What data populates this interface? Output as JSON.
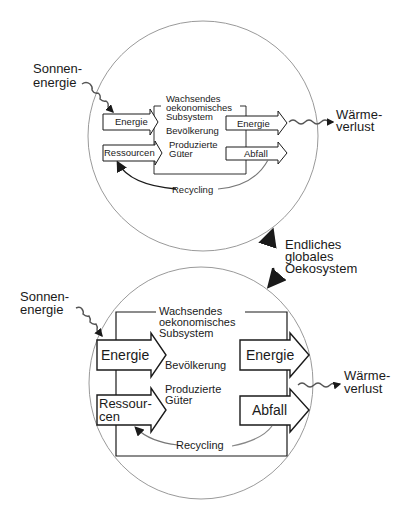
{
  "diagram": {
    "connector": {
      "label_lines": [
        "Endliches",
        "globales",
        "Oekosystem"
      ]
    },
    "top": {
      "input_label_lines": [
        "Sonnen-",
        "energie"
      ],
      "output_label_lines": [
        "Wärme-",
        "verlust"
      ],
      "subsystem_label_lines": [
        "Wachsendes",
        "oekonomisches",
        "Subsystem"
      ],
      "inner_labels": [
        "Bevölkerung",
        "Produzierte",
        "Güter"
      ],
      "inputs": [
        {
          "label": "Energie"
        },
        {
          "label": "Ressourcen"
        }
      ],
      "outputs": [
        {
          "label": "Energie"
        },
        {
          "label": "Abfall"
        }
      ],
      "recycling_label": "Recycling"
    },
    "bottom": {
      "input_label_lines": [
        "Sonnen-",
        "energie"
      ],
      "output_label_lines": [
        "Wärme-",
        "verlust"
      ],
      "subsystem_label_lines": [
        "Wachsendes",
        "oekonomisches",
        "Subsystem"
      ],
      "inner_labels": [
        "Bevölkerung",
        "Produzierte",
        "Güter"
      ],
      "inputs": [
        {
          "label": "Energie"
        },
        {
          "label_lines": [
            "Ressour-",
            "cen"
          ]
        }
      ],
      "outputs": [
        {
          "label": "Energie"
        },
        {
          "label": "Abfall"
        }
      ],
      "recycling_label": "Recycling"
    },
    "colors": {
      "line": "#1a1a1a",
      "circle": "#9a9a9a",
      "background": "#ffffff"
    }
  }
}
